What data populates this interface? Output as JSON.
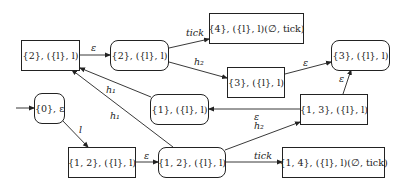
{
  "diagram": {
    "type": "state transition graph",
    "nodes": [
      {
        "id": "n2a",
        "label": "{2}, ({l}, l)",
        "shape": "rect"
      },
      {
        "id": "n2b",
        "label": "{2}, ({l}, l)",
        "shape": "rounded"
      },
      {
        "id": "n4",
        "label": "{4}, ({l}, l)(∅, tick)",
        "shape": "rect"
      },
      {
        "id": "n3a",
        "label": "{3}, ({l}, l)",
        "shape": "rect"
      },
      {
        "id": "n3b",
        "label": "{3}, ({l}, l)",
        "shape": "rounded"
      },
      {
        "id": "n1",
        "label": "{1}, ({l}, l)",
        "shape": "rounded"
      },
      {
        "id": "n13",
        "label": "{1, 3}, ({l}, l)",
        "shape": "rect"
      },
      {
        "id": "n0",
        "label": "{0}, ε",
        "shape": "rounded",
        "initial": true
      },
      {
        "id": "n12a",
        "label": "{1, 2}, ({l}, l)",
        "shape": "rect"
      },
      {
        "id": "n12b",
        "label": "{1, 2}, ({l}, l)",
        "shape": "rounded"
      },
      {
        "id": "n14",
        "label": "{1, 4}, ({l}, l)(∅, tick)",
        "shape": "rect"
      }
    ],
    "edges": [
      {
        "from": "n2a",
        "to": "n2b",
        "label": "ε"
      },
      {
        "from": "n2b",
        "to": "n4",
        "label": "tick"
      },
      {
        "from": "n2b",
        "to": "n3a",
        "label": "h₂"
      },
      {
        "from": "n3a",
        "to": "n3b",
        "label": "ε"
      },
      {
        "from": "n13",
        "to": "n3b",
        "label": "ε"
      },
      {
        "from": "n13",
        "to": "n1",
        "label": "ε"
      },
      {
        "from": "n1",
        "to": "n2a",
        "label": "h₁"
      },
      {
        "from": "n12b",
        "to": "n2a",
        "label": "h₁"
      },
      {
        "from": "n0",
        "to": "n12a",
        "label": "l"
      },
      {
        "from": "n12a",
        "to": "n12b",
        "label": "ε"
      },
      {
        "from": "n12b",
        "to": "n13",
        "label": "h₂"
      },
      {
        "from": "n12b",
        "to": "n14",
        "label": "tick"
      }
    ]
  }
}
